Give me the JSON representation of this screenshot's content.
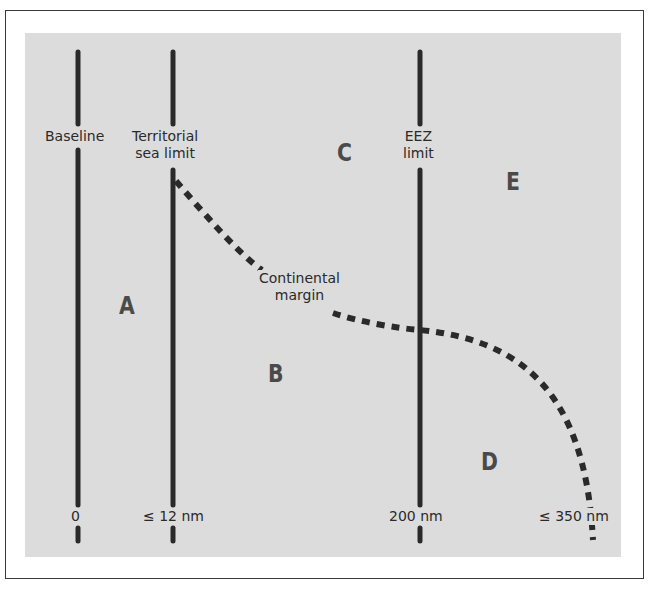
{
  "diagram": {
    "type": "maritime-zones",
    "colors": {
      "frame_border": "#3a3a3a",
      "panel_background": "#dcdcdc",
      "line_color": "#2a2a2a",
      "zone_letter_color": "#4a4a4a"
    },
    "boundaries": [
      {
        "id": "baseline",
        "label": "Baseline",
        "distance_label": "0"
      },
      {
        "id": "territorial-sea-limit",
        "label": "Territorial\nsea limit",
        "distance_label": "≤ 12 nm"
      },
      {
        "id": "eez-limit",
        "label": "EEZ\nlimit",
        "distance_label": "200 nm"
      },
      {
        "id": "continental-margin",
        "label": "Continental\nmargin",
        "distance_label": "≤ 350 nm",
        "style": "dashed"
      }
    ],
    "zones": [
      {
        "id": "A",
        "label": "A"
      },
      {
        "id": "B",
        "label": "B"
      },
      {
        "id": "C",
        "label": "C"
      },
      {
        "id": "D",
        "label": "D"
      },
      {
        "id": "E",
        "label": "E"
      }
    ]
  }
}
